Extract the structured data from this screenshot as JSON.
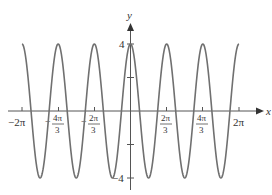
{
  "chart_data": {
    "type": "line",
    "title": "",
    "function": "y = 4cos(3x)",
    "xlabel": "x",
    "ylabel": "y",
    "xlim": [
      -6.2832,
      6.2832
    ],
    "ylim": [
      -4,
      4
    ],
    "grid": false,
    "legend": null,
    "x_ticks": [
      {
        "value": -6.2832,
        "label_main": "−2π",
        "label_num": "",
        "label_den": ""
      },
      {
        "value": -4.1888,
        "label_main": "",
        "label_num": "4π",
        "label_den": "3",
        "sign": "−"
      },
      {
        "value": -2.0944,
        "label_main": "",
        "label_num": "2π",
        "label_den": "3",
        "sign": "−"
      },
      {
        "value": 2.0944,
        "label_main": "",
        "label_num": "2π",
        "label_den": "3",
        "sign": ""
      },
      {
        "value": 4.1888,
        "label_main": "",
        "label_num": "4π",
        "label_den": "3",
        "sign": ""
      },
      {
        "value": 6.2832,
        "label_main": "2π",
        "label_num": "",
        "label_den": ""
      }
    ],
    "y_ticks": [
      {
        "value": 4,
        "label": "4"
      },
      {
        "value": 2,
        "label": ""
      },
      {
        "value": -2,
        "label": ""
      },
      {
        "value": -4,
        "label": "−4"
      }
    ],
    "series": [
      {
        "name": "4cos(3x)",
        "color": "#707070",
        "amplitude": 4,
        "frequency": 3,
        "x": [
          -6.2832,
          -5.236,
          -4.1888,
          -3.1416,
          -2.0944,
          -1.0472,
          0,
          1.0472,
          2.0944,
          3.1416,
          4.1888,
          5.236,
          6.2832
        ],
        "values": [
          4,
          -4,
          4,
          -4,
          4,
          -4,
          4,
          -4,
          4,
          -4,
          4,
          -4,
          4
        ]
      }
    ]
  },
  "labels": {
    "x_axis": "x",
    "y_axis": "y",
    "y_top": "4",
    "y_bottom": "−4",
    "xt_neg2pi": "−2π",
    "xt_neg4pi_num": "4π",
    "xt_neg4pi_den": "3",
    "xt_neg2pi3_num": "2π",
    "xt_neg2pi3_den": "3",
    "xt_2pi3_num": "2π",
    "xt_2pi3_den": "3",
    "xt_4pi3_num": "4π",
    "xt_4pi3_den": "3",
    "xt_2pi": "2π",
    "neg_sign": "−"
  }
}
